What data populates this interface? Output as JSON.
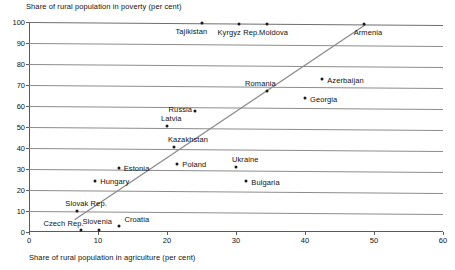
{
  "chart_data": {
    "type": "scatter",
    "title": "Share of rural population in poverty (per cent)",
    "xlabel": "Share of rural population in agriculture (per cent)",
    "ylabel": "Share of rural population in poverty (per cent)",
    "xlim": [
      0,
      60
    ],
    "ylim": [
      0,
      100
    ],
    "xticks": [
      0,
      10,
      20,
      30,
      40,
      50,
      60
    ],
    "yticks": [
      0,
      10,
      20,
      30,
      40,
      50,
      60,
      70,
      80,
      90,
      100
    ],
    "grid": "horizontal",
    "legend": "none",
    "points": [
      {
        "label": "Czech Rep.",
        "x": 7.6,
        "y": 1,
        "label_dx": -38,
        "label_dy": -11
      },
      {
        "label": "Slovenia",
        "x": 10.2,
        "y": 1,
        "label_dx": -17,
        "label_dy": -13
      },
      {
        "label": "Croatia",
        "x": 13.1,
        "y": 3,
        "label_dx": 5,
        "label_dy": -11
      },
      {
        "label": "Slovak Rep.",
        "x": 7.0,
        "y": 10,
        "label_dx": -12,
        "label_dy": -12
      },
      {
        "label": "Hungary",
        "x": 9.6,
        "y": 24.5,
        "label_dx": 5,
        "label_dy": -4
      },
      {
        "label": "Estonia",
        "x": 13.0,
        "y": 31,
        "label_dx": 5,
        "label_dy": -4
      },
      {
        "label": "Poland",
        "x": 21.5,
        "y": 33,
        "label_dx": 5,
        "label_dy": -4
      },
      {
        "label": "Kazakhstan",
        "x": 21.0,
        "y": 41,
        "label_dx": -6,
        "label_dy": -12
      },
      {
        "label": "Latvia",
        "x": 20.0,
        "y": 51,
        "label_dx": -6,
        "label_dy": -12
      },
      {
        "label": "Russia",
        "x": 24.0,
        "y": 58,
        "label_dx": -26,
        "label_dy": -6
      },
      {
        "label": "Ukraine",
        "x": 30.0,
        "y": 31.5,
        "label_dx": -4,
        "label_dy": -12
      },
      {
        "label": "Bulgaria",
        "x": 31.5,
        "y": 25,
        "label_dx": 5,
        "label_dy": -3
      },
      {
        "label": "Romania",
        "x": 34.5,
        "y": 68,
        "label_dx": -22,
        "label_dy": -12
      },
      {
        "label": "Georgia",
        "x": 40.0,
        "y": 65,
        "label_dx": 5,
        "label_dy": -3
      },
      {
        "label": "Azerbaijan",
        "x": 42.5,
        "y": 74,
        "label_dx": 5,
        "label_dy": -3
      },
      {
        "label": "Tajikistan",
        "x": 25.0,
        "y": 100,
        "label_dx": -26,
        "label_dy": 4
      },
      {
        "label": "Kyrgyz Rep.",
        "x": 30.5,
        "y": 100,
        "label_dx": -22,
        "label_dy": 4
      },
      {
        "label": "Moldova",
        "x": 34.5,
        "y": 100,
        "label_dx": -8,
        "label_dy": 4
      },
      {
        "label": "Armenia",
        "x": 48.5,
        "y": 100,
        "label_dx": -10,
        "label_dy": 4
      }
    ],
    "trendline": {
      "x0": 6.6,
      "y0": 6,
      "x1": 48.8,
      "y1": 100,
      "color": "#8a8a8a"
    }
  },
  "colors": {
    "point": "#1a1a1a",
    "grid": "#8c8c8c",
    "axis": "#5a5a5a",
    "trend": "#8a8a8a",
    "text": "#111111",
    "background": "#ffffff"
  }
}
